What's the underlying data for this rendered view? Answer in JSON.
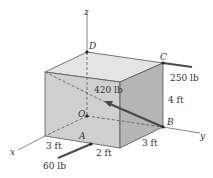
{
  "figure": {
    "axes": {
      "x": "x",
      "y": "y",
      "z": "z"
    },
    "points": {
      "D": "D",
      "C": "C",
      "O": "O",
      "B": "B",
      "A": "A"
    },
    "dimensions": {
      "height": "4 ft",
      "depth_right": "3 ft",
      "front_left": "3 ft",
      "front_right": "2 ft"
    },
    "forces": {
      "at_C": "250 lb",
      "at_B": "420 lb",
      "at_A": "60 lb"
    },
    "colors": {
      "top_face": "#e4e4e4",
      "front_face": "#cfcfcf",
      "right_face": "#b5b5b5",
      "edge": "#555555",
      "arrow": "#4a4a4a"
    }
  }
}
